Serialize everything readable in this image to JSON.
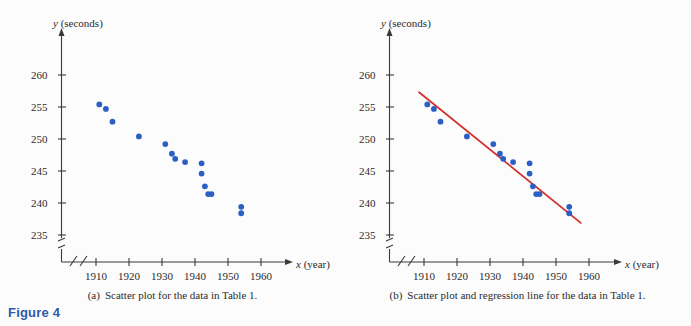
{
  "figure": {
    "label": "Figure 4",
    "label_color": "#2a5caa",
    "background": "#fcfcfd"
  },
  "panels": [
    {
      "id": "a",
      "caption_marker": "(a)",
      "caption_text": "Scatter plot for the data in Table 1."
    },
    {
      "id": "b",
      "caption_marker": "(b)",
      "caption_text": "Scatter plot and regression line for the data in Table 1."
    }
  ],
  "chart_data": [
    {
      "type": "scatter",
      "panel": "a",
      "title": "Scatter plot for the data in Table 1.",
      "xlabel": "x (year)",
      "ylabel": "y (seconds)",
      "x_axis_variable": "x",
      "x_axis_unit": "year",
      "y_axis_variable": "y",
      "y_axis_unit": "seconds",
      "xlim": [
        1905,
        1965
      ],
      "ylim": [
        233,
        262
      ],
      "x_ticks": [
        1910,
        1920,
        1930,
        1940,
        1950,
        1960
      ],
      "y_ticks": [
        235,
        240,
        245,
        250,
        255,
        260
      ],
      "axis_break_x": true,
      "axis_break_y": true,
      "grid": false,
      "legend": "none",
      "marker_color": "#2b5fc4",
      "points": [
        {
          "x": 1911,
          "y": 255.4
        },
        {
          "x": 1913,
          "y": 254.7
        },
        {
          "x": 1915,
          "y": 252.7
        },
        {
          "x": 1923,
          "y": 250.4
        },
        {
          "x": 1931,
          "y": 249.2
        },
        {
          "x": 1933,
          "y": 247.7
        },
        {
          "x": 1934,
          "y": 246.9
        },
        {
          "x": 1937,
          "y": 246.4
        },
        {
          "x": 1942,
          "y": 246.2
        },
        {
          "x": 1942,
          "y": 244.6
        },
        {
          "x": 1943,
          "y": 242.6
        },
        {
          "x": 1944,
          "y": 241.4
        },
        {
          "x": 1945,
          "y": 241.4
        },
        {
          "x": 1954,
          "y": 239.4
        },
        {
          "x": 1954,
          "y": 238.4
        }
      ]
    },
    {
      "type": "scatter",
      "panel": "b",
      "title": "Scatter plot and regression line for the data in Table 1.",
      "xlabel": "x (year)",
      "ylabel": "y (seconds)",
      "x_axis_variable": "x",
      "x_axis_unit": "year",
      "y_axis_variable": "y",
      "y_axis_unit": "seconds",
      "xlim": [
        1905,
        1965
      ],
      "ylim": [
        233,
        262
      ],
      "x_ticks": [
        1910,
        1920,
        1930,
        1940,
        1950,
        1960
      ],
      "y_ticks": [
        235,
        240,
        245,
        250,
        255,
        260
      ],
      "axis_break_x": true,
      "axis_break_y": true,
      "grid": false,
      "legend": "none",
      "marker_color": "#2b5fc4",
      "points": [
        {
          "x": 1911,
          "y": 255.4
        },
        {
          "x": 1913,
          "y": 254.7
        },
        {
          "x": 1915,
          "y": 252.7
        },
        {
          "x": 1923,
          "y": 250.4
        },
        {
          "x": 1931,
          "y": 249.2
        },
        {
          "x": 1933,
          "y": 247.7
        },
        {
          "x": 1934,
          "y": 246.9
        },
        {
          "x": 1937,
          "y": 246.4
        },
        {
          "x": 1942,
          "y": 246.2
        },
        {
          "x": 1942,
          "y": 244.6
        },
        {
          "x": 1943,
          "y": 242.6
        },
        {
          "x": 1944,
          "y": 241.4
        },
        {
          "x": 1945,
          "y": 241.4
        },
        {
          "x": 1954,
          "y": 239.4
        },
        {
          "x": 1954,
          "y": 238.4
        }
      ],
      "regression_line": {
        "color": "#d0312d",
        "x_start": 1908.5,
        "y_start": 257.3,
        "x_end": 1957.5,
        "y_end": 236.9
      }
    }
  ]
}
